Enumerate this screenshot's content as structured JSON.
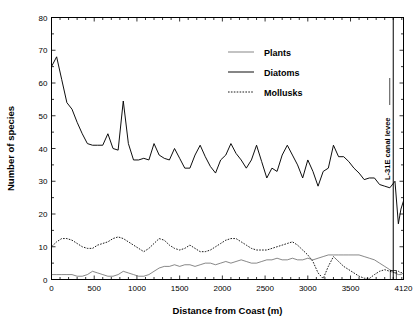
{
  "chart_data": {
    "type": "line",
    "title": "",
    "xlabel": "Distance from Coast (m)",
    "ylabel": "Number of species",
    "xlim": [
      0,
      4120
    ],
    "ylim": [
      0,
      80
    ],
    "xticks": [
      0,
      500,
      1000,
      1500,
      2000,
      2500,
      3000,
      3500,
      4120
    ],
    "xticklabels": [
      "0",
      "500",
      "1000",
      "1500",
      "2000",
      "2500",
      "3000",
      "3500",
      "4120"
    ],
    "yticks": [
      0,
      10,
      20,
      30,
      40,
      50,
      60,
      70,
      80
    ],
    "yticklabels": [
      "0",
      "10",
      "20",
      "30",
      "40",
      "50",
      "60",
      "70",
      "80"
    ],
    "grid": false,
    "legend_position": "upper-center",
    "x": [
      0,
      60,
      120,
      180,
      240,
      300,
      360,
      420,
      480,
      540,
      600,
      660,
      720,
      780,
      840,
      900,
      960,
      1020,
      1080,
      1140,
      1200,
      1260,
      1320,
      1380,
      1440,
      1500,
      1560,
      1620,
      1680,
      1740,
      1800,
      1860,
      1920,
      1980,
      2040,
      2100,
      2160,
      2220,
      2280,
      2340,
      2400,
      2460,
      2520,
      2580,
      2640,
      2700,
      2760,
      2820,
      2880,
      2940,
      3000,
      3060,
      3120,
      3180,
      3240,
      3300,
      3360,
      3420,
      3480,
      3540,
      3600,
      3660,
      3720,
      3780,
      3840,
      3900,
      3960,
      4020,
      4060,
      4090,
      4120
    ],
    "series": [
      {
        "name": "Diatoms",
        "style": "solid",
        "color": "#000000",
        "values": [
          65.0,
          68.0,
          61.0,
          54.0,
          52.0,
          48.0,
          44.5,
          41.5,
          41.0,
          41.0,
          41.0,
          44.5,
          40.0,
          39.5,
          54.5,
          41.5,
          36.5,
          36.5,
          37.0,
          36.5,
          41.5,
          38.0,
          37.0,
          36.5,
          40.0,
          37.0,
          34.0,
          34.0,
          38.0,
          41.0,
          37.5,
          34.5,
          32.5,
          36.5,
          38.0,
          41.5,
          38.5,
          36.5,
          34.0,
          36.5,
          41.0,
          36.0,
          31.0,
          34.0,
          33.0,
          38.0,
          41.0,
          38.0,
          35.0,
          31.0,
          36.5,
          33.0,
          28.5,
          33.0,
          34.0,
          41.0,
          37.5,
          37.5,
          36.0,
          34.0,
          32.5,
          30.5,
          31.0,
          31.0,
          29.0,
          28.5,
          28.0,
          30.0,
          17.0,
          21.5,
          24.0
        ]
      },
      {
        "name": "Mollusks",
        "style": "dotted",
        "color": "#000000",
        "values": [
          10.0,
          11.5,
          12.5,
          12.5,
          12.0,
          11.0,
          10.0,
          9.5,
          9.5,
          10.5,
          11.0,
          11.5,
          12.5,
          13.0,
          12.5,
          11.5,
          10.5,
          9.5,
          8.5,
          9.5,
          11.0,
          12.5,
          12.0,
          10.5,
          9.5,
          9.0,
          9.5,
          10.5,
          9.5,
          8.5,
          8.5,
          9.0,
          10.0,
          11.0,
          12.0,
          12.5,
          12.5,
          11.5,
          10.5,
          9.5,
          9.0,
          9.0,
          9.0,
          9.5,
          10.0,
          10.5,
          11.0,
          11.5,
          10.5,
          9.0,
          7.5,
          5.5,
          2.0,
          0.3,
          4.0,
          7.0,
          5.5,
          4.0,
          3.0,
          2.0,
          1.0,
          0.4,
          0.3,
          1.5,
          2.5,
          3.0,
          2.5,
          2.0,
          2.5,
          2.0,
          2.5
        ]
      },
      {
        "name": "Plants",
        "style": "thin",
        "color": "#555555",
        "values": [
          1.5,
          1.5,
          1.5,
          1.5,
          1.5,
          1.0,
          1.0,
          1.5,
          2.5,
          2.0,
          1.5,
          1.0,
          1.0,
          1.5,
          2.5,
          2.0,
          1.5,
          1.0,
          1.0,
          1.5,
          2.5,
          3.5,
          4.0,
          4.0,
          4.5,
          4.0,
          4.5,
          4.5,
          4.0,
          4.5,
          5.0,
          5.0,
          4.5,
          5.0,
          5.5,
          5.0,
          5.5,
          6.0,
          5.5,
          5.0,
          5.0,
          5.5,
          6.0,
          6.0,
          6.5,
          6.0,
          6.0,
          6.5,
          6.0,
          6.0,
          6.5,
          6.0,
          6.5,
          7.0,
          7.5,
          7.5,
          7.5,
          7.5,
          7.5,
          7.5,
          7.5,
          7.0,
          6.5,
          6.0,
          5.0,
          4.0,
          3.0,
          2.0,
          1.5,
          1.5,
          2.0
        ]
      }
    ],
    "annotations": [
      {
        "type": "vline",
        "label": "L-31E canal levee",
        "x": 4000,
        "orientation": "vertical"
      }
    ]
  },
  "legend": {
    "entries": [
      {
        "label": "Plants",
        "style": "thin"
      },
      {
        "label": "Diatoms",
        "style": "solid"
      },
      {
        "label": "Mollusks",
        "style": "dotted"
      }
    ]
  },
  "axes": {
    "x_title": "Distance from Coast (m)",
    "y_title": "Number of species"
  }
}
